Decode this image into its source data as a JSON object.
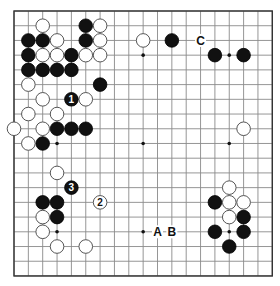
{
  "board": {
    "size": 19,
    "origin_x": 14,
    "origin_y": 11,
    "spacing_x": 14.35,
    "spacing_y": 14.72,
    "stone_radius": 6.8,
    "colors": {
      "line": "#8a8a8a",
      "border": "#333333",
      "black": "#111111",
      "white": "#ffffff"
    }
  },
  "hoshi": [
    [
      3,
      3
    ],
    [
      9,
      3
    ],
    [
      15,
      3
    ],
    [
      3,
      9
    ],
    [
      9,
      9
    ],
    [
      15,
      9
    ],
    [
      3,
      15
    ],
    [
      9,
      15
    ],
    [
      15,
      15
    ]
  ],
  "black_stones": [
    [
      5,
      1
    ],
    [
      1,
      2
    ],
    [
      2,
      2
    ],
    [
      5,
      2
    ],
    [
      1,
      3
    ],
    [
      4,
      3
    ],
    [
      1,
      4
    ],
    [
      2,
      4
    ],
    [
      3,
      4
    ],
    [
      4,
      4
    ],
    [
      6,
      5
    ],
    [
      3,
      8
    ],
    [
      4,
      8
    ],
    [
      5,
      8
    ],
    [
      2,
      9
    ],
    [
      2,
      13
    ],
    [
      3,
      13
    ],
    [
      3,
      14
    ],
    [
      11,
      2
    ],
    [
      14,
      3
    ],
    [
      16,
      3
    ],
    [
      14,
      13
    ],
    [
      16,
      14
    ],
    [
      14,
      15
    ],
    [
      16,
      15
    ],
    [
      15,
      16
    ]
  ],
  "white_stones": [
    [
      2,
      1
    ],
    [
      6,
      1
    ],
    [
      3,
      2
    ],
    [
      6,
      2
    ],
    [
      2,
      3
    ],
    [
      3,
      3
    ],
    [
      5,
      3
    ],
    [
      6,
      3
    ],
    [
      1,
      5
    ],
    [
      2,
      6
    ],
    [
      5,
      6
    ],
    [
      1,
      7
    ],
    [
      3,
      7
    ],
    [
      0,
      8
    ],
    [
      2,
      8
    ],
    [
      1,
      9
    ],
    [
      3,
      11
    ],
    [
      2,
      14
    ],
    [
      2,
      15
    ],
    [
      3,
      16
    ],
    [
      5,
      16
    ],
    [
      9,
      2
    ],
    [
      16,
      8
    ],
    [
      15,
      12
    ],
    [
      15,
      13
    ],
    [
      16,
      13
    ],
    [
      15,
      14
    ]
  ],
  "numbered_moves": [
    {
      "number": "1",
      "color": "black",
      "col": 4,
      "row": 6
    },
    {
      "number": "2",
      "color": "white",
      "col": 6,
      "row": 13
    },
    {
      "number": "3",
      "color": "black",
      "col": 4,
      "row": 12
    }
  ],
  "letter_labels": [
    {
      "text": "C",
      "col": 13,
      "row": 2
    },
    {
      "text": "A",
      "col": 10,
      "row": 15
    },
    {
      "text": "B",
      "col": 11,
      "row": 15
    }
  ]
}
